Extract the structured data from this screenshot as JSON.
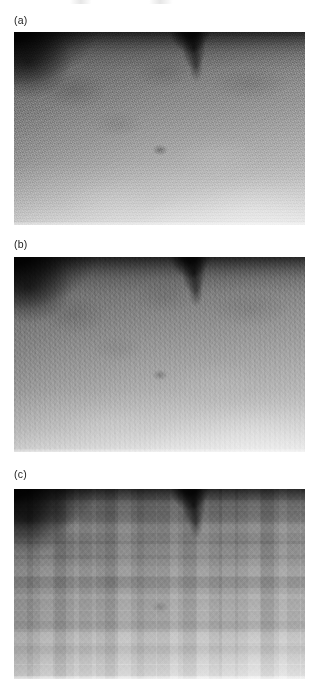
{
  "figure": {
    "background_color": "#ffffff",
    "width": 320,
    "height": 692,
    "cropped_caption_remnant": "",
    "panels": [
      {
        "label": "(a)",
        "name": "panel-a",
        "description": "original grayscale ultrasound image with fine speckle noise",
        "x": 14,
        "y": 32,
        "width": 291,
        "height": 193,
        "label_y": 14,
        "dark_corner": "top-left",
        "dark_wedge_x": 176,
        "texture": "fine-speckle",
        "mean_gray": "#9a9a9a"
      },
      {
        "label": "(b)",
        "name": "panel-b",
        "description": "smoothed / denoised version of the same image",
        "x": 14,
        "y": 257,
        "width": 291,
        "height": 195,
        "label_y": 238,
        "dark_corner": "top-left",
        "dark_wedge_x": 176,
        "texture": "medium-speckle",
        "mean_gray": "#9e9e9e"
      },
      {
        "label": "(c)",
        "name": "panel-c",
        "description": "block-quantised / compressed version showing blocking artifacts",
        "x": 14,
        "y": 489,
        "width": 291,
        "height": 190,
        "label_y": 468,
        "dark_corner": "top-left",
        "dark_wedge_x": 176,
        "texture": "coarse-blocky",
        "mean_gray": "#a6a6a6"
      }
    ]
  }
}
